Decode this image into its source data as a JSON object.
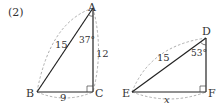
{
  "problem_number": "(2)",
  "triangle1": {
    "vertices": {
      "A": "A",
      "B": "B",
      "C": "C"
    },
    "sides": {
      "AB": "15",
      "AC": "12",
      "BC": "9"
    },
    "angle_A": "37°",
    "right_angle_at": "C"
  },
  "triangle2": {
    "vertices": {
      "D": "D",
      "E": "E",
      "F": "F"
    },
    "sides": {
      "ED": "15",
      "EF": "x"
    },
    "angle_D": "53°",
    "right_angle_at": "F"
  },
  "colors": {
    "line": "#222222",
    "dash": "#999999",
    "text": "#333333"
  }
}
